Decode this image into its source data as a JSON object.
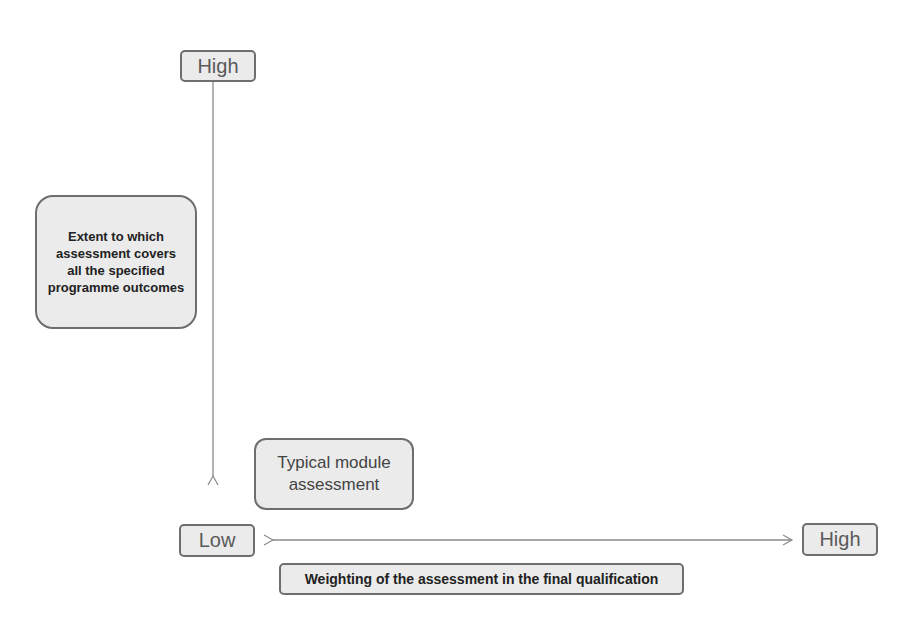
{
  "diagram": {
    "type": "2x-axis quadrant",
    "y_axis": {
      "high_label": "High",
      "low_label": "Low",
      "title": "Extent to which assessment covers all the specified programme outcomes"
    },
    "x_axis": {
      "low_label": "Low",
      "high_label": "High",
      "title": "Weighting of the assessment in the final qualification"
    },
    "items": [
      {
        "label": "Typical module assessment",
        "position": "low-x, low-y"
      }
    ]
  },
  "colors": {
    "box_fill": "#ebebeb",
    "box_border": "#6e6e6e",
    "arrow": "#8a8a8a"
  }
}
